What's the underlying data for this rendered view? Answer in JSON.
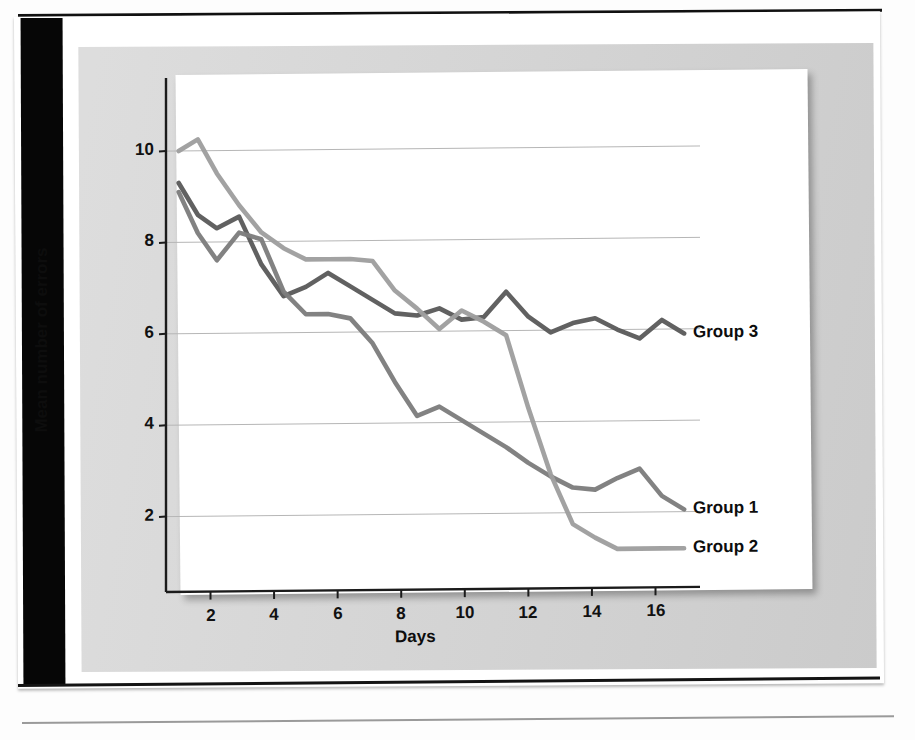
{
  "figure": {
    "background_color": "#d6d6d6",
    "plot_background_color": "#ffffff"
  },
  "chart_data": {
    "type": "line",
    "title": "",
    "xlabel": "Days",
    "ylabel": "Mean number of errors",
    "xlim": [
      0.6,
      17.4
    ],
    "ylim": [
      0.35,
      11.6
    ],
    "xticks": [
      2,
      4,
      6,
      8,
      10,
      12,
      14,
      16
    ],
    "yticks": [
      2,
      4,
      6,
      8,
      10
    ],
    "xtick_labels": [
      "2",
      "4",
      "6",
      "8",
      "10",
      "12",
      "14",
      "16"
    ],
    "ytick_labels": [
      "2",
      "4",
      "6",
      "8",
      "10"
    ],
    "grid": "horizontal",
    "legend_position": "inline-right-of-line-ends",
    "series": [
      {
        "name": "Group 3",
        "color": "#5b5b5b",
        "label_value": "Group 3",
        "x": [
          1.0,
          1.6,
          2.2,
          2.9,
          3.6,
          4.3,
          5.0,
          5.7,
          6.4,
          7.1,
          7.8,
          8.5,
          9.2,
          9.9,
          10.6,
          11.3,
          12.0,
          12.7,
          13.4,
          14.1,
          14.8,
          15.5,
          16.2,
          16.9
        ],
        "y": [
          9.3,
          8.6,
          8.3,
          8.55,
          7.5,
          6.8,
          7.0,
          7.3,
          7.0,
          6.7,
          6.4,
          6.35,
          6.5,
          6.25,
          6.3,
          6.85,
          6.3,
          5.95,
          6.15,
          6.25,
          6.0,
          5.8,
          6.2,
          5.9
        ]
      },
      {
        "name": "Group 1",
        "color": "#7d7d7d",
        "label_value": "Group 1",
        "x": [
          1.0,
          1.6,
          2.2,
          2.9,
          3.6,
          4.3,
          5.0,
          5.7,
          6.4,
          7.1,
          7.8,
          8.5,
          9.2,
          9.9,
          10.6,
          11.3,
          12.0,
          12.7,
          13.4,
          14.1,
          14.8,
          15.5,
          16.2,
          16.9
        ],
        "y": [
          9.1,
          8.2,
          7.6,
          8.2,
          8.05,
          6.9,
          6.4,
          6.4,
          6.3,
          5.75,
          4.9,
          4.15,
          4.35,
          4.05,
          3.75,
          3.45,
          3.1,
          2.8,
          2.55,
          2.5,
          2.75,
          2.95,
          2.35,
          2.05
        ]
      },
      {
        "name": "Group 2",
        "color": "#9e9e9e",
        "label_value": "Group 2",
        "x": [
          1.0,
          1.6,
          2.2,
          2.9,
          3.6,
          4.3,
          5.0,
          5.7,
          6.4,
          7.1,
          7.8,
          8.5,
          9.2,
          9.9,
          10.6,
          11.3,
          12.0,
          12.7,
          13.4,
          14.1,
          14.8,
          15.5,
          16.2,
          16.9
        ],
        "y": [
          10.0,
          10.25,
          9.5,
          8.8,
          8.2,
          7.85,
          7.6,
          7.6,
          7.6,
          7.55,
          6.9,
          6.5,
          6.05,
          6.45,
          6.2,
          5.9,
          4.3,
          2.85,
          1.75,
          1.45,
          1.2,
          1.2,
          1.2,
          1.2
        ]
      }
    ]
  }
}
